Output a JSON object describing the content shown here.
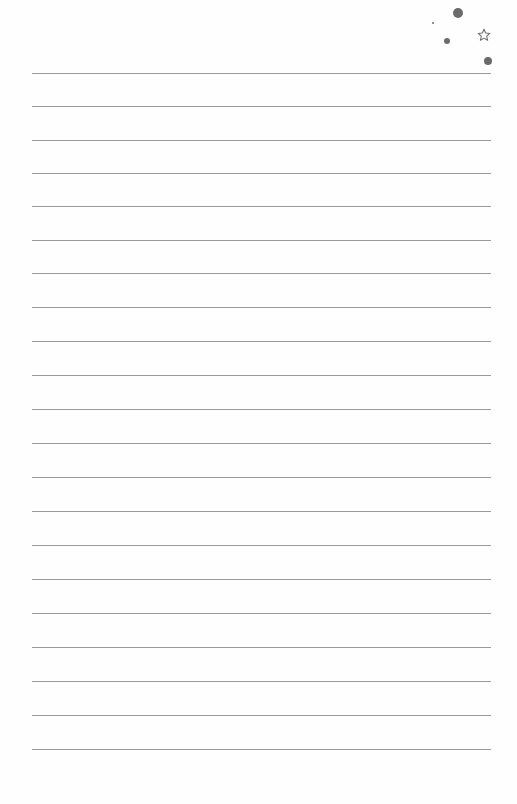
{
  "page": {
    "type": "lined-notebook-page",
    "background_color": "#fefefe",
    "rule_color": "#9a9a9a",
    "rule_count": 21,
    "rules_y": [
      73,
      106,
      140,
      173,
      206,
      240,
      273,
      307,
      341,
      375,
      409,
      443,
      477,
      511,
      545,
      579,
      613,
      647,
      681,
      715,
      749
    ],
    "rule_x_start": 32,
    "rule_x_end": 491
  },
  "decorations": {
    "dots": [
      {
        "name": "large-dot-top",
        "cx": 458,
        "cy": 13,
        "r": 5
      },
      {
        "name": "tiny-dot",
        "cx": 433,
        "cy": 23,
        "r": 1
      },
      {
        "name": "small-dot",
        "cx": 447,
        "cy": 41,
        "r": 3
      },
      {
        "name": "dot-right",
        "cx": 488,
        "cy": 61,
        "r": 4
      }
    ],
    "star": {
      "name": "star-outline",
      "cx": 484,
      "cy": 35,
      "size": 14,
      "color": "#6b6b6b"
    }
  }
}
